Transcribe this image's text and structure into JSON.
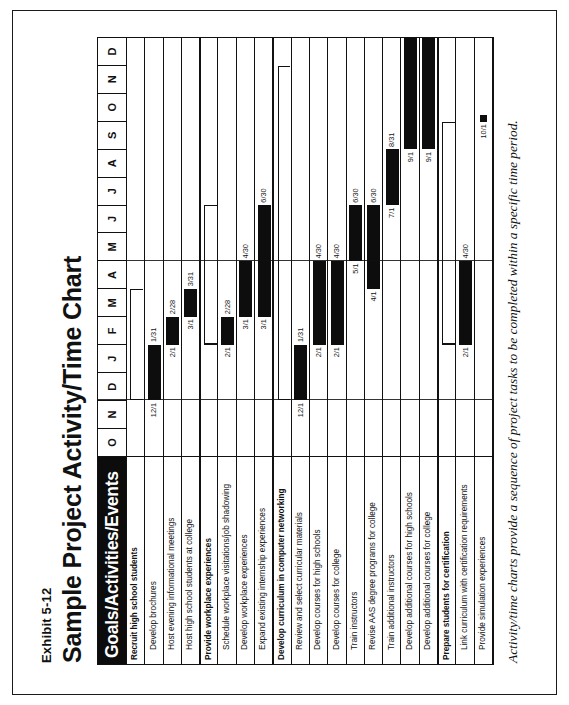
{
  "exhibit": {
    "number": "Exhibit 5-12",
    "title": "Sample Project Activity/Time Chart"
  },
  "table": {
    "header_label": "Goals/Activities/Events"
  },
  "caption": "Activity/time charts provide a sequence of project tasks to be completed within a specific time period.",
  "colors": {
    "bar": "#0d0d0d",
    "header_bg": "#0c0c0c",
    "header_text": "#ffffff",
    "border": "#111111"
  },
  "chart_data": {
    "type": "bar",
    "subtype": "gantt",
    "title": "Sample Project Activity/Time Chart",
    "xlabel": "",
    "ylabel": "Goals/Activities/Events",
    "grid": true,
    "legend": "none",
    "categories": [
      "O",
      "N",
      "D",
      "J",
      "F",
      "M",
      "A",
      "M",
      "J",
      "J",
      "A",
      "S",
      "O",
      "N",
      "D"
    ],
    "x_axis_months": [
      "O",
      "N",
      "D",
      "J",
      "F",
      "M",
      "A",
      "M",
      "J",
      "J",
      "A",
      "S",
      "O",
      "N",
      "D"
    ],
    "month_count": 15,
    "rows": [
      {
        "label": "Recruit high school students",
        "type": "group",
        "start": "12/1",
        "end": "3/31",
        "start_index": 2.0,
        "end_index": 6.0,
        "show_dates": false
      },
      {
        "label": "Develop brochures",
        "type": "task",
        "start": "12/1",
        "end": "1/31",
        "start_index": 2.0,
        "end_index": 4.0,
        "show_dates": true
      },
      {
        "label": "Host evening informational meetings",
        "type": "task",
        "start": "2/1",
        "end": "2/28",
        "start_index": 4.0,
        "end_index": 5.0,
        "show_dates": true
      },
      {
        "label": "Host high school students at college",
        "type": "task",
        "start": "3/1",
        "end": "3/31",
        "start_index": 5.0,
        "end_index": 6.0,
        "show_dates": true
      },
      {
        "label": "Provide workplace experiences",
        "type": "group",
        "start": "2/1",
        "end": "6/30",
        "start_index": 4.0,
        "end_index": 9.0,
        "show_dates": false
      },
      {
        "label": "Schedule workplace visitations/job shadowing",
        "type": "task",
        "start": "2/1",
        "end": "2/28",
        "start_index": 4.0,
        "end_index": 5.0,
        "show_dates": true
      },
      {
        "label": "Develop workplace experiences",
        "type": "task",
        "start": "3/1",
        "end": "4/30",
        "start_index": 5.0,
        "end_index": 7.0,
        "show_dates": true
      },
      {
        "label": "Expand existing internship experiences",
        "type": "task",
        "start": "3/1",
        "end": "6/30",
        "start_index": 5.0,
        "end_index": 9.0,
        "show_dates": true
      },
      {
        "label": "Develop curriculum in computer networking",
        "type": "group",
        "start": "12/1",
        "end": "9/1",
        "start_index": 2.0,
        "end_index": 14.0,
        "show_dates": false
      },
      {
        "label": "Review and select curricular materials",
        "type": "task",
        "start": "12/1",
        "end": "1/31",
        "start_index": 2.0,
        "end_index": 4.0,
        "show_dates": true
      },
      {
        "label": "Develop courses for high schools",
        "type": "task",
        "start": "2/1",
        "end": "4/30",
        "start_index": 4.0,
        "end_index": 7.0,
        "show_dates": true
      },
      {
        "label": "Develop courses for college",
        "type": "task",
        "start": "2/1",
        "end": "4/30",
        "start_index": 4.0,
        "end_index": 7.0,
        "show_dates": true
      },
      {
        "label": "Train instructors",
        "type": "task",
        "start": "5/1",
        "end": "6/30",
        "start_index": 7.0,
        "end_index": 9.0,
        "show_dates": true
      },
      {
        "label": "Revise AAS degree programs for college",
        "type": "task",
        "start": "4/1",
        "end": "6/30",
        "start_index": 6.0,
        "end_index": 9.0,
        "show_dates": true
      },
      {
        "label": "Train additional instructors",
        "type": "task",
        "start": "7/1",
        "end": "8/31",
        "start_index": 9.0,
        "end_index": 11.0,
        "show_dates": true
      },
      {
        "label": "Develop additional courses for high schools",
        "type": "task",
        "start": "9/1",
        "end": "",
        "start_index": 11.0,
        "end_index": 15.0,
        "show_dates": true
      },
      {
        "label": "Develop additional courses for college",
        "type": "task",
        "start": "9/1",
        "end": "",
        "start_index": 11.0,
        "end_index": 15.0,
        "show_dates": true
      },
      {
        "label": "Prepare students for certification",
        "type": "group",
        "start": "2/1",
        "end": "10/1",
        "start_index": 4.0,
        "end_index": 12.0,
        "show_dates": false
      },
      {
        "label": "Link curriculum with certification requirements",
        "type": "task",
        "start": "2/1",
        "end": "4/30",
        "start_index": 4.0,
        "end_index": 7.0,
        "show_dates": true
      },
      {
        "label": "Provide simulation experiences",
        "type": "milestone",
        "start": "10/1",
        "end": "10/1",
        "start_index": 12.0,
        "end_index": 12.0,
        "show_dates": true
      }
    ]
  }
}
